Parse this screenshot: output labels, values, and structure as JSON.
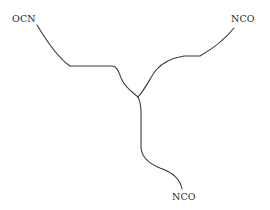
{
  "diagram": {
    "type": "branched-molecule-schematic",
    "stroke_color": "#3a3a3a",
    "background": "#ffffff",
    "labels": {
      "top_left": "OCN",
      "top_right": "NCO",
      "bottom": "NCO"
    },
    "branches": [
      {
        "name": "left-arm",
        "end_group": "OCN"
      },
      {
        "name": "right-arm",
        "end_group": "NCO"
      },
      {
        "name": "bottom-arm",
        "end_group": "NCO"
      }
    ]
  }
}
